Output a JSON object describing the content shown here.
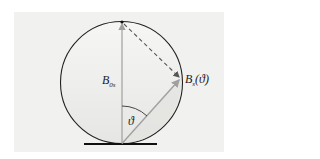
{
  "diagram": {
    "type": "vector circle diagram",
    "labels": {
      "vertical_vector": "B",
      "vertical_vector_sub": "0s",
      "angled_vector": "B",
      "angled_vector_sub": "s",
      "angled_vector_arg": "(ϑ)",
      "angle": "ϑ"
    },
    "colors": {
      "circle_stroke": "#222222",
      "arrow": "#a0a0a0",
      "dashed": "#555555",
      "ground": "#111111",
      "fill": "#f1f1f0"
    }
  }
}
